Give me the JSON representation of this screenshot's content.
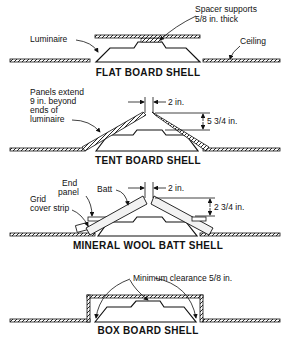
{
  "diagram": {
    "colors": {
      "ink": "#111111",
      "background": "#ffffff"
    },
    "panels": [
      {
        "title": "FLAT BOARD SHELL",
        "labels": {
          "luminaire": "Luminaire",
          "spacer_line1": "Spacer supports",
          "spacer_line2": "5/8 in. thick",
          "ceiling": "Ceiling"
        }
      },
      {
        "title": "TENT BOARD SHELL",
        "labels": {
          "panels_line1": "Panels extend",
          "panels_line2": "9 in. beyond",
          "panels_line3": "ends of",
          "panels_line4": "luminaire",
          "gap": "2 in.",
          "height": "5 3/4 in."
        }
      },
      {
        "title": "MINERAL WOOL BATT SHELL",
        "labels": {
          "end_panel_line1": "End",
          "end_panel_line2": "panel",
          "batt": "Batt",
          "grid_line1": "Grid",
          "grid_line2": "cover strip",
          "gap": "2 in.",
          "height": "2 3/4 in."
        }
      },
      {
        "title": "BOX BOARD SHELL",
        "labels": {
          "clearance": "Minimum clearance 5/8 in."
        }
      }
    ]
  }
}
